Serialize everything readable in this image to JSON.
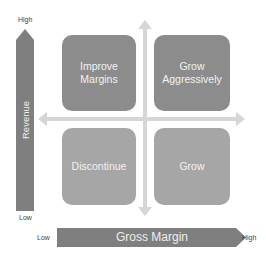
{
  "diagram": {
    "type": "2x2-matrix",
    "y_axis": {
      "label": "Revenue",
      "high_label": "High",
      "low_label": "Low"
    },
    "x_axis": {
      "label": "Gross Margin",
      "low_label": "Low",
      "high_label": "High"
    },
    "quadrants": [
      {
        "position": "top-left",
        "line1": "Improve",
        "line2": "Margins",
        "color": "#8c8c8c"
      },
      {
        "position": "top-right",
        "line1": "Grow",
        "line2": "Aggressively",
        "color": "#8c8c8c"
      },
      {
        "position": "bottom-left",
        "line1": "Discontinue",
        "line2": "",
        "color": "#a6a6a6"
      },
      {
        "position": "bottom-right",
        "line1": "Grow",
        "line2": "",
        "color": "#a6a6a6"
      }
    ],
    "colors": {
      "axis_arrow": "#7f7f7f",
      "cross_arrows": "#d9d9d9",
      "top_quadrants": "#8c8c8c",
      "bottom_quadrants": "#a6a6a6"
    }
  }
}
